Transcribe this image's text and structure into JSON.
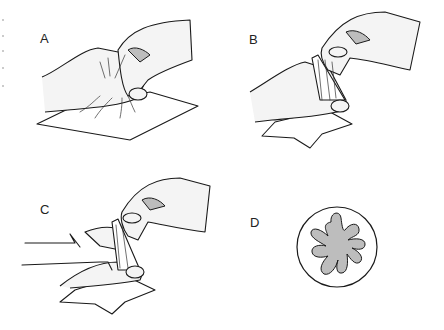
{
  "figure": {
    "panels": [
      {
        "id": "A",
        "label": "A",
        "description": "Hand pinching center of gauze square"
      },
      {
        "id": "B",
        "label": "B",
        "description": "Gauze gathered into a cone between fingers"
      },
      {
        "id": "C",
        "label": "C",
        "description": "Gauze cone with arrows indicating cut across the gathered tip"
      },
      {
        "id": "D",
        "label": "D",
        "description": "Circular cross-section showing folded gauze pattern"
      }
    ],
    "colors": {
      "line": "#1a1a1a",
      "skin": "#f4f4f4",
      "shading": "#bdbdbd",
      "background": "#ffffff"
    }
  }
}
